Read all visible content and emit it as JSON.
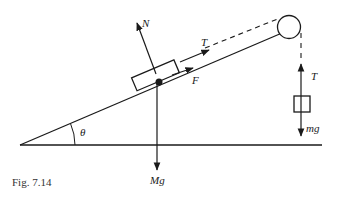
{
  "figure": {
    "caption": "Fig. 7.14",
    "labels": {
      "normal": "N",
      "tension_block": "T",
      "friction": "F",
      "weight_block": "Mg",
      "angle": "θ",
      "tension_hanging": "T",
      "weight_hanging": "mg"
    },
    "colors": {
      "ink": "#1a1a1a",
      "background": "#ffffff"
    }
  }
}
